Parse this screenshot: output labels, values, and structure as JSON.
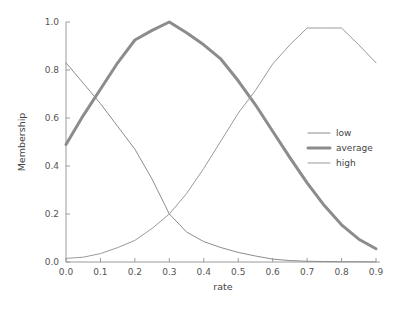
{
  "chart_data": {
    "type": "line",
    "title": "",
    "xlabel": "rate",
    "ylabel": "Membership",
    "xlim": [
      0.0,
      0.9
    ],
    "ylim": [
      0.0,
      1.0
    ],
    "grid": false,
    "legend_position": "center-right",
    "xticks": [
      "0.0",
      "0.1",
      "0.2",
      "0.3",
      "0.4",
      "0.5",
      "0.6",
      "0.7",
      "0.8",
      "0.9"
    ],
    "xtick_values": [
      0.0,
      0.1,
      0.2,
      0.3,
      0.4,
      0.5,
      0.6,
      0.7,
      0.8,
      0.9
    ],
    "yticks": [
      "0.0",
      "0.2",
      "0.4",
      "0.6",
      "0.8",
      "1.0"
    ],
    "ytick_values": [
      0.0,
      0.2,
      0.4,
      0.6,
      0.8,
      1.0
    ],
    "x": [
      0.0,
      0.05,
      0.1,
      0.15,
      0.2,
      0.25,
      0.3,
      0.35,
      0.4,
      0.45,
      0.5,
      0.55,
      0.6,
      0.65,
      0.7,
      0.75,
      0.8,
      0.85,
      0.9
    ],
    "series": [
      {
        "name": "low",
        "color": "#8c8c8c",
        "linewidth": 1.0,
        "values": [
          0.83,
          0.745,
          0.66,
          0.565,
          0.47,
          0.345,
          0.2,
          0.125,
          0.085,
          0.06,
          0.04,
          0.025,
          0.012,
          0.006,
          0.003,
          0.002,
          0.001,
          0.001,
          0.0
        ]
      },
      {
        "name": "average",
        "color": "#8c8c8c",
        "linewidth": 3.0,
        "values": [
          0.49,
          0.61,
          0.72,
          0.83,
          0.925,
          0.965,
          1.0,
          0.955,
          0.905,
          0.845,
          0.755,
          0.655,
          0.545,
          0.435,
          0.33,
          0.235,
          0.155,
          0.095,
          0.055
        ]
      },
      {
        "name": "high",
        "color": "#9a9a9a",
        "linewidth": 1.0,
        "values": [
          0.015,
          0.02,
          0.035,
          0.06,
          0.09,
          0.14,
          0.2,
          0.285,
          0.39,
          0.505,
          0.62,
          0.715,
          0.825,
          0.905,
          0.975,
          0.975,
          0.975,
          0.905,
          0.83
        ]
      }
    ]
  },
  "legend": {
    "items": [
      {
        "label": "low"
      },
      {
        "label": "average"
      },
      {
        "label": "high"
      }
    ]
  }
}
